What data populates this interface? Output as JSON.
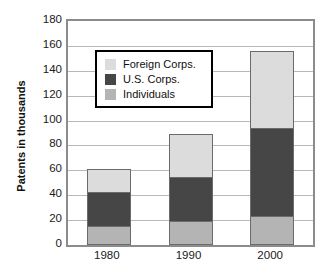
{
  "chart_data": {
    "type": "bar",
    "title": "",
    "subtitle": "",
    "xlabel": "",
    "ylabel": "Patents in thousands",
    "categories": [
      "1980",
      "1990",
      "2000"
    ],
    "ylim": [
      0,
      180
    ],
    "yticks": [
      0,
      20,
      40,
      60,
      80,
      100,
      120,
      140,
      160,
      180
    ],
    "ytick_labels": [
      "0",
      "20",
      "40",
      "60",
      "80",
      "100",
      "120",
      "140",
      "160",
      "180"
    ],
    "stacked": true,
    "stack_order_bottom_to_top": [
      "Individuals",
      "U.S. Corps.",
      "Foreign Corps."
    ],
    "grid": true,
    "grid_axis": "y",
    "legend_position": "upper-left-inside",
    "series": [
      {
        "name": "Individuals",
        "color": "#b4b4b4",
        "values": [
          14,
          18,
          22
        ]
      },
      {
        "name": "U.S. Corps.",
        "color": "#464646",
        "values": [
          28,
          36,
          71
        ]
      },
      {
        "name": "Foreign Corps.",
        "color": "#dcdcdc",
        "values": [
          19,
          35,
          63
        ]
      }
    ],
    "totals": [
      61,
      89,
      156
    ],
    "cumulative_tops": {
      "Individuals": [
        14,
        18,
        22
      ],
      "U.S. Corps.": [
        42,
        54,
        93
      ],
      "Foreign Corps.": [
        61,
        89,
        156
      ]
    }
  },
  "legend": {
    "entries": [
      {
        "label": "Foreign Corps.",
        "color": "#dcdcdc"
      },
      {
        "label": "U.S. Corps.",
        "color": "#464646"
      },
      {
        "label": "Individuals",
        "color": "#b4b4b4"
      }
    ]
  },
  "colors": {
    "foreign_corps": "#dcdcdc",
    "us_corps": "#464646",
    "individuals": "#b4b4b4",
    "plot_border": "#8c8c8c",
    "gridline": "#b8b8b8",
    "bar_outline": "#6b6b6b",
    "text": "#111111",
    "background": "#ffffff"
  }
}
